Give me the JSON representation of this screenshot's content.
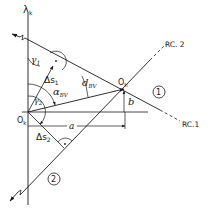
{
  "diagram": {
    "axis_label": "λ",
    "axis_label_sub": "k",
    "points": {
      "origin_k": {
        "label": "O",
        "sub": "k"
      },
      "origin_h": {
        "label": "O",
        "sub": "h"
      }
    },
    "angles": {
      "gamma1": {
        "label": "γ",
        "sub": "1"
      },
      "gamma2": {
        "label": "γ",
        "sub": "2"
      },
      "alpha_bv": {
        "label": "α",
        "sub": "BV"
      }
    },
    "distances": {
      "delta_s1": {
        "label": "Δs",
        "sub": "1"
      },
      "delta_s2": {
        "label": "Δs",
        "sub": "2"
      },
      "d_bv": {
        "label": "d",
        "sub": "BV"
      },
      "a": {
        "label": "a"
      },
      "b": {
        "label": "b"
      }
    },
    "lines": {
      "line1": {
        "marker": "1",
        "end_label": "RC.1"
      },
      "line2": {
        "marker": "2",
        "end_label": "RC. 2"
      }
    },
    "colors": {
      "stroke": "#1a1a1a",
      "background": "#ffffff"
    }
  }
}
